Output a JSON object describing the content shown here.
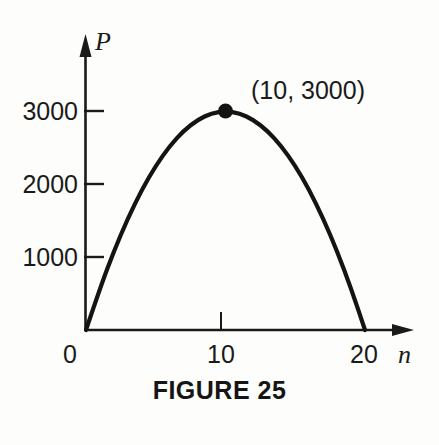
{
  "figure": {
    "caption": "FIGURE 25",
    "background_color": "#fdfdfb",
    "ink_color": "#1a1a1a"
  },
  "chart_data": {
    "type": "line",
    "title": "FIGURE 25",
    "xlabel": "n",
    "ylabel": "P",
    "xlim": [
      0,
      22
    ],
    "ylim": [
      0,
      3450
    ],
    "grid": false,
    "legend": false,
    "curve_description": "downward-opening parabola P = 30n(20 - n) with roots at n = 0 and n = 20 and vertex at (10, 3000)",
    "x": [
      0,
      1,
      2,
      3,
      4,
      5,
      6,
      7,
      8,
      9,
      10,
      11,
      12,
      13,
      14,
      15,
      16,
      17,
      18,
      19,
      20
    ],
    "y": [
      0,
      570,
      1080,
      1530,
      1920,
      2250,
      2520,
      2730,
      2880,
      2970,
      3000,
      2970,
      2880,
      2730,
      2520,
      2250,
      1920,
      1530,
      1080,
      570,
      0
    ],
    "xticks": [
      {
        "value": 0,
        "label": "0"
      },
      {
        "value": 10,
        "label": "10"
      },
      {
        "value": 20,
        "label": "20"
      }
    ],
    "yticks": [
      {
        "value": 1000,
        "label": "1000"
      },
      {
        "value": 2000,
        "label": "2000"
      },
      {
        "value": 3000,
        "label": "3000"
      }
    ],
    "annotations": [
      {
        "name": "vertex",
        "label": "(10, 3000)",
        "x": 10,
        "y": 3000,
        "marker": "filled-circle"
      }
    ]
  },
  "labels": {
    "y_axis_name": "P",
    "x_axis_name": "n",
    "y_tick_3000": "3000",
    "y_tick_2000": "2000",
    "y_tick_1000": "1000",
    "x_tick_0": "0",
    "x_tick_10": "10",
    "x_tick_20": "20",
    "vertex_annotation": "(10, 3000)"
  }
}
